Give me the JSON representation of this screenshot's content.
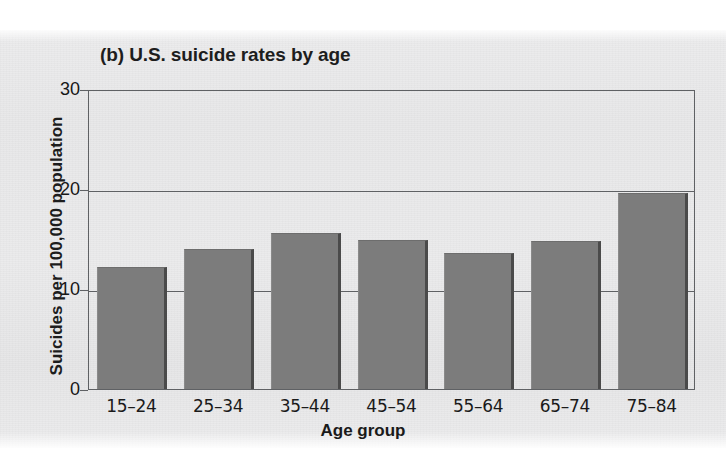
{
  "chart_data": {
    "type": "bar",
    "title": "(b) U.S. suicide rates by age",
    "xlabel": "Age group",
    "ylabel": "Suicides per 100,000 population",
    "categories": [
      "15–24",
      "25–34",
      "35–44",
      "45–54",
      "55–64",
      "65–74",
      "75–84"
    ],
    "values": [
      12.2,
      14.0,
      15.6,
      14.9,
      13.6,
      14.8,
      19.6
    ],
    "ylim": [
      0,
      30
    ],
    "yticks": [
      0,
      10,
      20,
      30
    ],
    "ytick_labels": [
      "0",
      "10",
      "20",
      "30"
    ],
    "grid": true,
    "legend": "none",
    "bar_color": "#7c7c7c",
    "axis_color": "#5f6164",
    "text_color": "#1a1a1a",
    "background_color": "#eaeaeb"
  }
}
